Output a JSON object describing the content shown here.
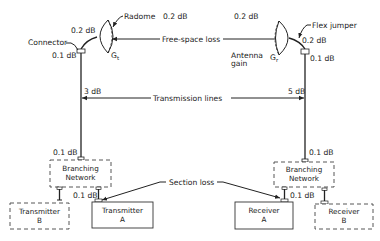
{
  "diagram": {
    "labels": {
      "radome": "Radome",
      "radome_loss": "0.2 dB",
      "rx_radome_loss": "0.2 dB",
      "connector": "Connector",
      "tx_flex_loss": "0.2 dB",
      "tx_connector_loss": "0.1 dB",
      "tx_gain": "G",
      "tx_gain_sub": "t",
      "rx_gain": "G",
      "rx_gain_sub": "r",
      "free_space_loss": "Free-space loss",
      "antenna_gain_line1": "Antenna",
      "antenna_gain_line2": "gain",
      "flex_jumper": "Flex jumper",
      "rx_flex_loss": "0.2 dB",
      "rx_connector_loss": "0.1 dB",
      "tx_line_loss": "3 dB",
      "rx_line_loss": "5 dB",
      "transmission_lines": "Transmission lines",
      "tx_bn_top_loss": "0.1 dB",
      "rx_bn_top_loss": "0.1 dB",
      "tx_bn_bottom_loss": "0.1 dB",
      "rx_bn_bottom_loss": "0.1 dB",
      "section_loss": "Section loss"
    },
    "boxes": {
      "tx_branching_line1": "Branching",
      "tx_branching_line2": "Network",
      "rx_branching_line1": "Branching",
      "rx_branching_line2": "Network",
      "transmitter_b_line1": "Transmitter",
      "transmitter_b_line2": "B",
      "transmitter_a_line1": "Transmitter",
      "transmitter_a_line2": "A",
      "receiver_a_line1": "Receiver",
      "receiver_a_line2": "A",
      "receiver_b_line1": "Receiver",
      "receiver_b_line2": "B"
    },
    "colors": {
      "ink": "#222222",
      "background": "#ffffff"
    }
  }
}
